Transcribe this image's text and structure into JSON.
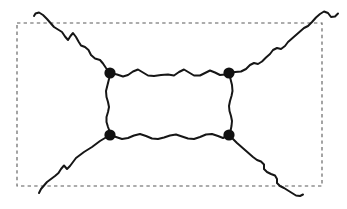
{
  "figure": {
    "type": "feynman-box-diagram",
    "canvas": {
      "width": 347,
      "height": 209
    },
    "background_color": "#ffffff",
    "line_color": "#161616",
    "line_width": 2,
    "vertex_color": "#111111",
    "vertex_radius": 5.6,
    "boundary_color": "#5a5a5a",
    "boundary_dash": "3.4 3.2"
  },
  "boundary": {
    "label": "dashed-region-boundary",
    "x": 17,
    "y": 23,
    "width": 305,
    "height": 163
  },
  "vertices": [
    {
      "name": "vertex-top-left",
      "x": 110,
      "y": 73
    },
    {
      "name": "vertex-top-right",
      "x": 229,
      "y": 73
    },
    {
      "name": "vertex-bottom-left",
      "x": 110,
      "y": 135
    },
    {
      "name": "vertex-bottom-right",
      "x": 229,
      "y": 135
    }
  ],
  "internal_lines": [
    {
      "name": "internal-line-top",
      "from": "vertex-top-left",
      "to": "vertex-top-right",
      "path": "M110,73 L117,74.5 L123,76.5 L128,75 L133,71.5 L138,69.5 L143,72.5 L148,75.5 L154,76 L161,75 L168,74.5 L174,75.5 L179,72 L184,69.5 L189,72.5 L194,75.5 L200,75.5 L205,73 L210,70.5 L215,72.5 L220,75 L225,74.5 L229,73"
    },
    {
      "name": "internal-line-bottom",
      "from": "vertex-bottom-left",
      "to": "vertex-bottom-right",
      "path": "M110,135 L116,137 L122,139 L128,138 L134,135.5 L140,134 L146,136 L152,138.5 L158,139 L164,137.5 L170,135.5 L176,134.5 L182,136.5 L188,138.5 L194,139 L200,137 L206,134.5 L212,134 L218,136 L223,138 L229,135"
    },
    {
      "name": "internal-line-left",
      "from": "vertex-top-left",
      "to": "vertex-bottom-left",
      "path": "M110,73 L109,79 L107.5,85 L106,91 L106.5,97 L108,102 L109,107 L108,112 L106.5,117 L106.5,122 L108,127 L109.5,131 L110,135"
    },
    {
      "name": "internal-line-right",
      "from": "vertex-top-right",
      "to": "vertex-bottom-right",
      "path": "M229,73 L230.5,79 L232,85 L232.5,91 L231.5,96 L230,101 L229,106 L229.5,111 L231,116 L232,121 L231.5,126 L230.5,131 L229,135"
    }
  ],
  "external_legs": [
    {
      "name": "external-leg-top-left",
      "attached_to": "vertex-top-left",
      "direction": "up-left",
      "crosses_boundary": true,
      "path": "M110,73 L106,68 L103,63.5 L100,60 L95,58.5 L91,55 L88.5,50 L85,47 L81,45.5 L78.5,41.5 L76,37 L73,33 L70.5,36 L68,40 L65,36.5 L62,32 L58,29.5 L54,27 L50.5,23 L47,19 L43,15 L39,12.5 L35.5,13.5 L34,16"
    },
    {
      "name": "external-leg-top-right",
      "attached_to": "vertex-top-right",
      "direction": "up-right",
      "crosses_boundary": true,
      "path": "M229,73 L235,72 L241,71.5 L246,69 L250,65 L254,63 L258,64 L262,61.5 L266,57.5 L270,54 L273,50 L277,48 L281,49 L285,46 L288,42 L292,38.5 L296,35 L300,31.5 L304,28 L308,26 L312,22 L316,17.5 L320,14 L324,11.5 L328,13 L331,17 L335,16.5 L338,13.5"
    },
    {
      "name": "external-leg-bottom-left",
      "attached_to": "vertex-bottom-left",
      "direction": "down-left",
      "crosses_boundary": true,
      "path": "M110,135 L105,138 L100,141 L96,144 L92,147 L88,149.5 L84,152 L80,155 L76,158 L73,162 L70,166 L67,169 L64,165.5 L61,169 L58.5,173 L55,176 L51,179 L47,182 L44,185.5 L41,189 L39,193"
    },
    {
      "name": "external-leg-bottom-right",
      "attached_to": "vertex-bottom-right",
      "direction": "down-right",
      "crosses_boundary": true,
      "path": "M229,135 L233,139 L237,143 L241,146.5 L245,150 L249,153.5 L253,157 L257,160 L261,161.5 L264,164.5 L264,169 L267,172 L271,174 L275,175.5 L277,179 L277,183 L280,186 L284,188 L288,190.5 L292,193 L296,195.5 L300,196 L303,194.5"
    }
  ]
}
